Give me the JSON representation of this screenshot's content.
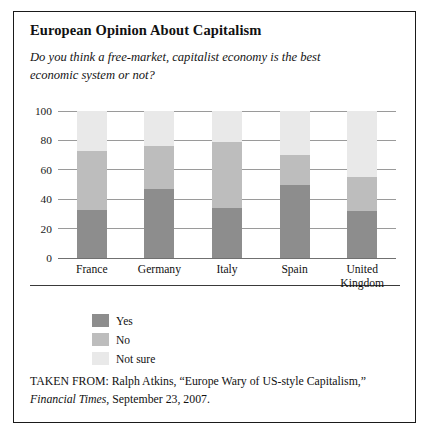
{
  "figure": {
    "title": "European Opinion About Capitalism",
    "subtitle": "Do you think a free-market, capitalist economy is the best economic system or not?",
    "source_prefix": "TAKEN FROM: Ralph Atkins, “Europe Wary of US-style Capitalism,” ",
    "source_publication": "Financial Times",
    "source_suffix": ", September 23, 2007."
  },
  "colors": {
    "yes": "#8d8d8d",
    "no": "#bdbdbd",
    "not_sure": "#e9e9e9",
    "gridline": "#9a9a9a",
    "frame": "#1a1a1a"
  },
  "chart_data": {
    "type": "bar",
    "title": "European Opinion About Capitalism",
    "subtitle": "Do you think a free-market, capitalist economy is the best economic system or not?",
    "stacked": true,
    "xlabel": "",
    "ylabel": "",
    "ylim": [
      0,
      100
    ],
    "yticks": [
      0,
      20,
      40,
      60,
      80,
      100
    ],
    "ytick_labels": [
      "0",
      "20",
      "40",
      "60",
      "80",
      "100"
    ],
    "grid": true,
    "legend_position": "below-left",
    "categories": [
      "France",
      "Germany",
      "Italy",
      "Spain",
      "United Kingdom"
    ],
    "category_lines": [
      [
        "France"
      ],
      [
        "Germany"
      ],
      [
        "Italy"
      ],
      [
        "Spain"
      ],
      [
        "United",
        "Kingdom"
      ]
    ],
    "series": [
      {
        "name": "Yes",
        "color": "#8d8d8d",
        "values": [
          33,
          47,
          34,
          50,
          32
        ]
      },
      {
        "name": "No",
        "color": "#bdbdbd",
        "values": [
          40,
          29,
          45,
          20,
          23
        ]
      },
      {
        "name": "Not sure",
        "color": "#e9e9e9",
        "values": [
          27,
          24,
          21,
          30,
          45
        ]
      }
    ]
  }
}
